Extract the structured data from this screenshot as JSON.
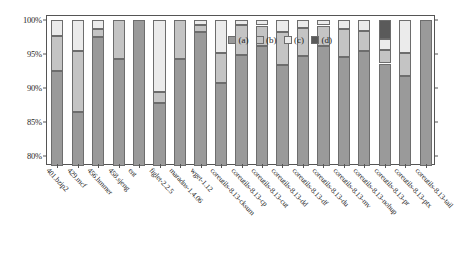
{
  "chart_data": {
    "type": "bar",
    "subtype": "stacked-bar-percent",
    "title": "",
    "xlabel": "",
    "ylabel": "",
    "ylim": [
      78.5,
      100.6
    ],
    "grid": false,
    "legend_position": "top-center",
    "ytick_labels": [
      "100%",
      "95%",
      "90%",
      "85%",
      "80%"
    ],
    "ytick_values": [
      100,
      95,
      90,
      85,
      80
    ],
    "legend": [
      "(a)",
      "(b)",
      "(c)",
      "(d)"
    ],
    "colors": {
      "a": "#9a9a9a",
      "b": "#c4c4c4",
      "c": "#ebebeb",
      "d": "#5a5a5a",
      "axis": "#555555",
      "text": "#1f1f1f",
      "background": "#ffffff"
    },
    "categories": [
      "401.bzip2",
      "429.mcf",
      "456.hmmer",
      "458.sjeng",
      "ent",
      "figlet-2.2.5",
      "maradns-1.4.06",
      "wget-1.12",
      "coreutils-8.13-cksum",
      "coreutils-8.13-cp",
      "coreutils-8.13-cut",
      "coreutils-8.13-dd",
      "coreutils-8.13-df",
      "coreutils-8.13-du",
      "coreutils-8.13-mv",
      "coreutils-8.13-nohup",
      "coreutils-8.13-pr",
      "coreutils-8.13-ptx",
      "coreutils-8.13-tail"
    ],
    "series": [
      {
        "name": "(a)",
        "values": [
          92.5,
          86.4,
          97.5,
          94.3,
          100.0,
          87.8,
          94.3,
          98.3,
          90.8,
          94.9,
          96.2,
          93.4,
          94.7,
          96.2,
          94.6,
          95.4,
          93.6,
          91.8,
          100.0
        ]
      },
      {
        "name": "(b)",
        "values": [
          5.2,
          9.0,
          1.2,
          5.7,
          0.0,
          1.6,
          5.7,
          1.0,
          4.4,
          4.4,
          3.0,
          4.9,
          4.1,
          3.0,
          4.1,
          3.0,
          2.0,
          3.4,
          0.0
        ]
      },
      {
        "name": "(c)",
        "values": [
          2.3,
          4.6,
          1.3,
          0.0,
          0.0,
          10.6,
          0.0,
          0.7,
          4.8,
          0.7,
          0.8,
          1.7,
          1.2,
          0.8,
          1.3,
          1.6,
          1.6,
          4.8,
          0.0
        ]
      },
      {
        "name": "(d)",
        "values": [
          0.0,
          0.0,
          0.0,
          0.0,
          0.0,
          0.0,
          0.0,
          0.0,
          0.0,
          0.0,
          0.0,
          0.0,
          0.0,
          0.0,
          0.0,
          0.0,
          2.8,
          0.0,
          0.0
        ]
      }
    ]
  }
}
